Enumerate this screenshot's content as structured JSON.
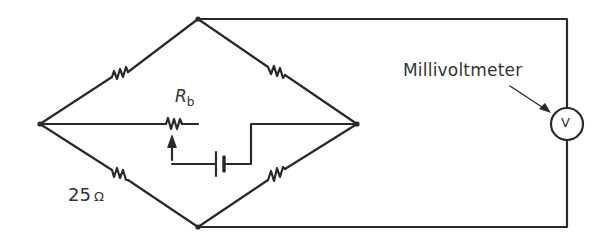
{
  "diagram": {
    "labels": {
      "meter": "Millivoltmeter",
      "resistance": "25",
      "resistance_unit": "Ω",
      "rb_main": "R",
      "rb_sub": "b",
      "meter_symbol": "V"
    },
    "stroke_color": "#2a2a2a",
    "components": [
      {
        "type": "resistor",
        "branch": "left-top"
      },
      {
        "type": "resistor",
        "branch": "top-right"
      },
      {
        "type": "resistor",
        "branch": "left-bottom",
        "label": "25 Ω"
      },
      {
        "type": "resistor",
        "branch": "bottom-right"
      },
      {
        "type": "variable-resistor",
        "branch": "middle",
        "label": "Rb"
      },
      {
        "type": "battery",
        "branch": "middle"
      },
      {
        "type": "voltmeter",
        "label": "V"
      }
    ]
  }
}
